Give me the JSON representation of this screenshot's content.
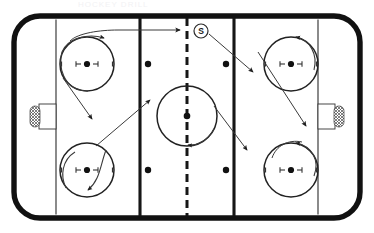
{
  "diagram": {
    "faded_header_text": "HOCKEY DRILL",
    "sport": "ice-hockey",
    "view": "full-rink-top-down",
    "colors": {
      "board_outline": "#111111",
      "ice_surface": "#ffffff",
      "line": "#1a1a1a",
      "path_line": "#3a3a3a",
      "marker_fill": "#ffffff",
      "marker_stroke": "#2a2a2a"
    }
  },
  "rink": {
    "boards_label": "boards",
    "corner_radius": "24",
    "goal_lines": [
      {
        "name": "left-goal-line",
        "x": 56
      },
      {
        "name": "right-goal-line",
        "x": 318
      }
    ],
    "blue_lines": [
      {
        "name": "left-blue-line",
        "x": 140
      },
      {
        "name": "right-blue-line",
        "x": 234
      }
    ],
    "center_line": {
      "name": "center-red-line",
      "x": 187,
      "style": "dashed"
    },
    "nets": [
      {
        "name": "left-net",
        "x": 39,
        "y": 104,
        "width": 17,
        "height": 25
      },
      {
        "name": "right-net",
        "x": 318,
        "y": 104,
        "width": 17,
        "height": 25
      }
    ]
  },
  "faceoff": {
    "circles": [
      {
        "name": "faceoff-circle-top-left",
        "cx": 87,
        "cy": 64,
        "r": 27
      },
      {
        "name": "faceoff-circle-bottom-left",
        "cx": 87,
        "cy": 170,
        "r": 27
      },
      {
        "name": "faceoff-circle-top-right",
        "cx": 291,
        "cy": 64,
        "r": 27
      },
      {
        "name": "faceoff-circle-bottom-right",
        "cx": 291,
        "cy": 170,
        "r": 27
      },
      {
        "name": "center-ice-circle",
        "cx": 187,
        "cy": 116,
        "r": 30
      }
    ],
    "neutral_zone_dots": [
      {
        "name": "neutral-dot-top-left",
        "cx": 148,
        "cy": 64
      },
      {
        "name": "neutral-dot-top-right",
        "cx": 226,
        "cy": 64
      },
      {
        "name": "neutral-dot-bottom-left",
        "cx": 148,
        "cy": 170
      },
      {
        "name": "neutral-dot-bottom-right",
        "cx": 226,
        "cy": 170
      }
    ]
  },
  "markers": [
    {
      "name": "shooter-marker",
      "label": "S",
      "cx": 201,
      "cy": 31,
      "r": 7,
      "description": "Start / shooter position at top of center ice"
    }
  ],
  "paths": [
    {
      "name": "path-top-left-loop-to-neutral",
      "type": "skating-path",
      "arrow": "open-head",
      "description": "Loops around top-left faceoff circle then drives right across the blue line"
    },
    {
      "name": "path-top-left-to-bottom-left-diagonal",
      "type": "skating-path",
      "arrow": "solid-head",
      "description": "Diagonal from top-left circle down to bottom-left circle area"
    },
    {
      "name": "path-bottom-left-to-center-diagonal",
      "type": "skating-path",
      "arrow": "solid-head",
      "description": "Diagonal from bottom-left circle up toward center ice / left blue line"
    },
    {
      "name": "path-shooter-to-top-right",
      "type": "pass-path",
      "arrow": "solid-head",
      "description": "From the S marker diagonally down-right toward the right zone"
    },
    {
      "name": "path-center-to-bottom-right",
      "type": "skating-path",
      "arrow": "solid-head",
      "description": "From center ice circle diagonally down-right to the bottom-right circle"
    },
    {
      "name": "path-top-right-loop",
      "type": "skating-path",
      "arrow": "open-head",
      "description": "Curl around the top-right faceoff circle"
    },
    {
      "name": "path-bottom-right-loop",
      "type": "skating-path",
      "arrow": "solid-head",
      "description": "Curl around the bottom-right faceoff circle"
    }
  ]
}
